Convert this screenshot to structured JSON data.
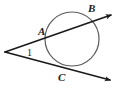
{
  "figure": {
    "background_color": "#ffffff",
    "stroke_color": "#1a1a1a",
    "circle_stroke_color": "#555555",
    "labels": {
      "point_a": "A",
      "point_b": "B",
      "point_c": "C",
      "angle_1": "1"
    }
  },
  "geometry": {
    "circle": {
      "cx": 72,
      "cy": 39,
      "r": 27,
      "stroke_width": 1.2
    },
    "external_vertex": {
      "x": 5,
      "y": 52
    },
    "secant_line": {
      "name": "secant-through-A-and-B",
      "from": {
        "x": 5,
        "y": 52
      },
      "to": {
        "x": 114,
        "y": 14
      },
      "intersection_a": {
        "x": 49,
        "y": 37
      },
      "intersection_b": {
        "x": 95,
        "y": 21
      }
    },
    "tangent_line": {
      "name": "tangent-at-C",
      "from": {
        "x": 5,
        "y": 52
      },
      "to": {
        "x": 113,
        "y": 81
      },
      "tangent_point_c": {
        "x": 64,
        "y": 66
      }
    },
    "arrowheads": [
      {
        "name": "arrow-upper-right",
        "x": 114,
        "y": 14
      },
      {
        "name": "arrow-lower-right",
        "x": 113,
        "y": 81
      }
    ]
  }
}
